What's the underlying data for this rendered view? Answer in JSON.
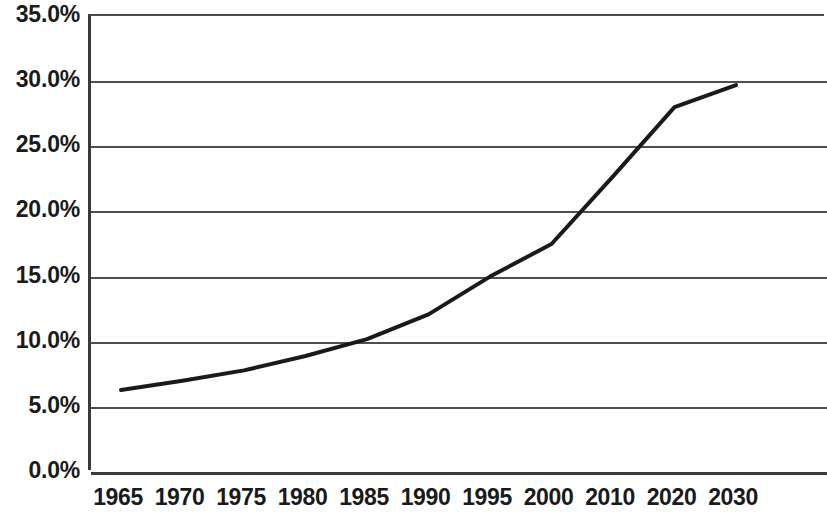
{
  "chart_data": {
    "type": "line",
    "title": "",
    "subtitle": "",
    "xlabel": "",
    "ylabel": "",
    "categories": [
      "1965",
      "1970",
      "1975",
      "1980",
      "1985",
      "1990",
      "1995",
      "2000",
      "2010",
      "2020",
      "2030"
    ],
    "series": [
      {
        "name": "",
        "values": [
          6.3,
          7.0,
          7.8,
          8.9,
          10.2,
          12.1,
          15.0,
          17.5,
          22.7,
          28.0,
          29.7
        ]
      }
    ],
    "ylim": [
      0.0,
      35.0
    ],
    "y_tick_values": [
      0.0,
      5.0,
      10.0,
      15.0,
      20.0,
      25.0,
      30.0,
      35.0
    ],
    "y_tick_labels": [
      "0.0%",
      "5.0%",
      "10.0%",
      "15.0%",
      "20.0%",
      "25.0%",
      "30.0%",
      "35.0%"
    ],
    "grid": true,
    "grid_axis": "y",
    "legend": false,
    "legend_position": "none",
    "line_color": "#1a1a1a",
    "line_width": 4,
    "markers": false,
    "plot_background": "#ffffff",
    "gridline_color": "#4f4f4f",
    "axis_color": "#3a3a3a",
    "text_color": "#1a1a1a",
    "annotations": []
  }
}
